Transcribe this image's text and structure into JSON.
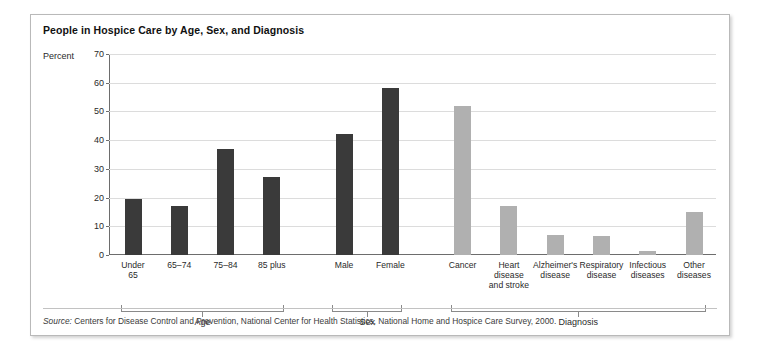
{
  "figure": {
    "title": "People in Hospice Care by Age, Sex, and Diagnosis",
    "axis_unit_label": "Percent",
    "source_prefix": "Source:",
    "source_text": " Centers for Disease Control and Prevention, National Center for Health Statistics, National Home and Hospice Care Survey, 2000."
  },
  "colors": {
    "bar_dark": "#3a3a3a",
    "bar_light": "#b0b0b0",
    "axis": "#6d6d6d",
    "gridline": "#dcdcdc",
    "frame": "#b9b9b9"
  },
  "chart_data": {
    "type": "bar",
    "title": "People in Hospice Care by Age, Sex, and Diagnosis",
    "xlabel": "",
    "ylabel": "Percent",
    "ylim": [
      0,
      70
    ],
    "yticks": [
      0,
      10,
      20,
      30,
      40,
      50,
      60,
      70
    ],
    "grid": true,
    "legend": "none",
    "categories": [
      "Under 65",
      "65–74",
      "75–84",
      "85 plus",
      "Male",
      "Female",
      "Cancer",
      "Heart disease and stroke",
      "Alzheimer's disease",
      "Respiratory disease",
      "Infectious diseases",
      "Other diseases"
    ],
    "values": [
      19.5,
      17,
      37,
      27,
      42,
      58,
      52,
      17,
      7,
      6.5,
      1.5,
      15
    ],
    "bars": [
      {
        "label_lines": [
          "Under",
          "65"
        ],
        "value": 19.5,
        "group": "Age",
        "color": "dark"
      },
      {
        "label_lines": [
          "65–74"
        ],
        "value": 17,
        "group": "Age",
        "color": "dark"
      },
      {
        "label_lines": [
          "75–84"
        ],
        "value": 37,
        "group": "Age",
        "color": "dark"
      },
      {
        "label_lines": [
          "85 plus"
        ],
        "value": 27,
        "group": "Age",
        "color": "dark"
      },
      {
        "label_lines": [
          "Male"
        ],
        "value": 42,
        "group": "Sex",
        "color": "dark"
      },
      {
        "label_lines": [
          "Female"
        ],
        "value": 58,
        "group": "Sex",
        "color": "dark"
      },
      {
        "label_lines": [
          "Cancer"
        ],
        "value": 52,
        "group": "Diagnosis",
        "color": "light"
      },
      {
        "label_lines": [
          "Heart",
          "disease",
          "and stroke"
        ],
        "value": 17,
        "group": "Diagnosis",
        "color": "light"
      },
      {
        "label_lines": [
          "Alzheimer's",
          "disease"
        ],
        "value": 7,
        "group": "Diagnosis",
        "color": "light"
      },
      {
        "label_lines": [
          "Respiratory",
          "disease"
        ],
        "value": 6.5,
        "group": "Diagnosis",
        "color": "light"
      },
      {
        "label_lines": [
          "Infectious",
          "diseases"
        ],
        "value": 1.5,
        "group": "Diagnosis",
        "color": "light"
      },
      {
        "label_lines": [
          "Other",
          "diseases"
        ],
        "value": 15,
        "group": "Diagnosis",
        "color": "light"
      }
    ],
    "groups": [
      {
        "label": "Age",
        "first": 0,
        "last": 3
      },
      {
        "label": "Sex",
        "first": 4,
        "last": 5
      },
      {
        "label": "Diagnosis",
        "first": 6,
        "last": 11
      }
    ]
  }
}
